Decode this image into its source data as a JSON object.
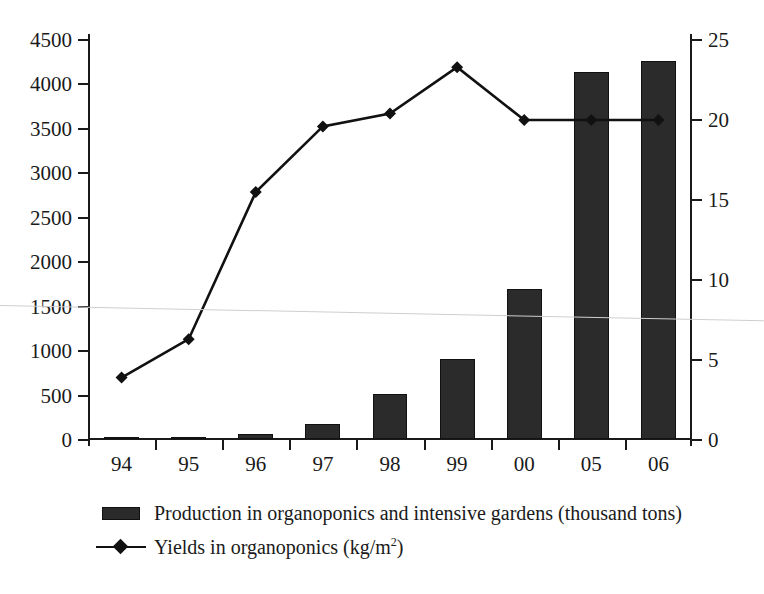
{
  "chart_data": {
    "type": "bar",
    "title": "",
    "subtitle": "",
    "xlabel": "",
    "ylabel": "",
    "grid": false,
    "legend_position": "bottom-left",
    "categories": [
      "94",
      "95",
      "96",
      "97",
      "98",
      "99",
      "00",
      "05",
      "06"
    ],
    "axes": {
      "left": {
        "label": "Production in organoponics and intensive gardens (thousand tons)",
        "min": 0,
        "max": 4500,
        "step": 500,
        "ticks": [
          0,
          500,
          1000,
          1500,
          2000,
          2500,
          3000,
          3500,
          4000,
          4500
        ],
        "tick_labels": [
          "0",
          "500",
          "1000",
          "1500",
          "2000",
          "2500",
          "3000",
          "3500",
          "4000",
          "4500"
        ]
      },
      "right": {
        "label": "Yields in organoponics (kg/m2)",
        "min": 0,
        "max": 25,
        "step": 5,
        "ticks": [
          0,
          5,
          10,
          15,
          20,
          25
        ],
        "tick_labels": [
          "0",
          "5",
          "10",
          "15",
          "20",
          "25"
        ]
      }
    },
    "series": [
      {
        "name": "Production in organoponics and intensive gardens (thousand tons)",
        "type": "bar",
        "axis": "left",
        "color": "#2b2b2b",
        "values": [
          4,
          20,
          62,
          170,
          506,
          900,
          1690,
          4130,
          4250
        ]
      },
      {
        "name": "Yields in organoponics (kg/m2)",
        "type": "line",
        "axis": "right",
        "color": "#111111",
        "marker": "diamond",
        "values": [
          3.9,
          6.3,
          15.5,
          19.6,
          20.4,
          23.3,
          20.0,
          20.0,
          20.0
        ]
      }
    ]
  },
  "legend": {
    "items": [
      {
        "key": "bar-swatch",
        "label": "Production in organoponics and intensive gardens (thousand tons)"
      },
      {
        "key": "line-swatch",
        "label_prefix": "Yields in organoponics (kg/m",
        "label_sup": "2",
        "label_suffix": ")"
      }
    ]
  }
}
